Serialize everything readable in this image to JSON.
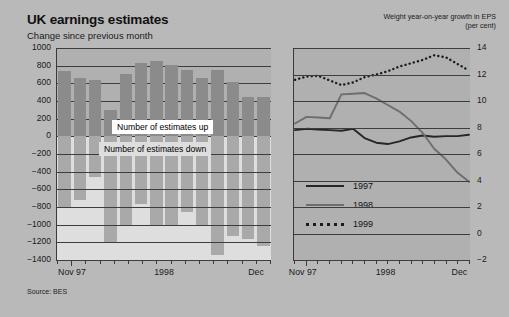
{
  "header": {
    "main_title": "UK earnings estimates",
    "subtitle": "Change since previous month",
    "right_title_line1": "Weight year-on-year growth in EPS",
    "right_title_line2": "(per cent)"
  },
  "source": "Source: BES",
  "colors": {
    "background": "#b9b9b9",
    "plot_background": "#b0b0b0",
    "band_background": "#dedede",
    "bar_up": "#8b8b8b",
    "bar_down": "#a9a9a9",
    "line_1997": "#262626",
    "line_1998": "#6e6e6e",
    "line_1999": "#1c1c1c",
    "axis": "#3a3a3a"
  },
  "chart_data": [
    {
      "type": "bar",
      "id": "uk-earnings-estimates",
      "title": "UK earnings estimates",
      "subtitle": "Change since previous month",
      "xlabel": "",
      "ylabel": "",
      "ylim": [
        -1400,
        1000
      ],
      "yticks": [
        1000,
        800,
        600,
        400,
        200,
        0,
        -200,
        -400,
        -600,
        -800,
        -1000,
        -1200,
        -1400
      ],
      "ytick_labels": [
        "1000",
        "800",
        "600",
        "400",
        "200",
        "0",
        "-200",
        "-400",
        "-600",
        "-800",
        "-1000",
        "-1200",
        "-1400"
      ],
      "grid": true,
      "xtick_labels": [
        "Nov 97",
        "1998",
        "Dec"
      ],
      "xtick_label_positions": [
        0.07,
        0.5,
        0.93
      ],
      "categories": [
        "Nov 97",
        "Dec 97",
        "Jan 98",
        "Feb 98",
        "Mar 98",
        "Apr 98",
        "May 98",
        "Jun 98",
        "Jul 98",
        "Aug 98",
        "Sep 98",
        "Oct 98",
        "Nov 98",
        "Dec 98"
      ],
      "series": [
        {
          "name": "Number of estimates up",
          "values": [
            740,
            660,
            640,
            300,
            710,
            830,
            850,
            805,
            755,
            660,
            750,
            620,
            450,
            445
          ]
        },
        {
          "name": "Number of estimates down",
          "values": [
            -800,
            -720,
            -460,
            -1210,
            -1000,
            -770,
            -1000,
            -1010,
            -855,
            -1000,
            -1340,
            -1130,
            -1160,
            -1240
          ]
        }
      ],
      "band_labels": {
        "up": "Number of estimates up",
        "down": "Number of estimates down"
      }
    },
    {
      "type": "line",
      "id": "weighted-eps-growth",
      "title": "Weight year-on-year growth in EPS",
      "subtitle": "(per cent)",
      "xlabel": "",
      "ylabel": "per cent",
      "ylim": [
        -2,
        14
      ],
      "yticks": [
        14,
        12,
        10,
        8,
        6,
        4,
        2,
        0,
        -2
      ],
      "ytick_labels": [
        "14",
        "12",
        "10",
        "8",
        "6",
        "4",
        "2",
        "0",
        "-2"
      ],
      "grid": true,
      "xtick_labels": [
        "Nov 97",
        "1998",
        "Dec"
      ],
      "xtick_label_positions": [
        0.05,
        0.52,
        0.94
      ],
      "legend_position": "lower-left",
      "series": [
        {
          "name": "1997",
          "style": "solid",
          "color": "#262626",
          "x": [
            0,
            1,
            2,
            3,
            4,
            5,
            6,
            7,
            8,
            9,
            10,
            11,
            12,
            13,
            14,
            15
          ],
          "values": [
            7.8,
            7.9,
            7.85,
            7.8,
            7.75,
            7.9,
            7.2,
            6.85,
            6.75,
            6.95,
            7.25,
            7.4,
            7.3,
            7.35,
            7.35,
            7.45
          ]
        },
        {
          "name": "1998",
          "style": "solid",
          "color": "#6e6e6e",
          "x": [
            0,
            1,
            2,
            3,
            4,
            5,
            6,
            7,
            8,
            9,
            10,
            11,
            12,
            13,
            14,
            15
          ],
          "values": [
            8.3,
            8.8,
            8.75,
            8.7,
            10.5,
            10.55,
            10.6,
            10.2,
            9.7,
            9.2,
            8.5,
            7.6,
            6.4,
            5.6,
            4.6,
            3.9
          ]
        },
        {
          "name": "1999",
          "style": "dotted",
          "color": "#1c1c1c",
          "x": [
            0,
            1,
            2,
            3,
            4,
            5,
            6,
            7,
            8,
            9,
            10,
            11,
            12,
            13,
            14,
            15
          ],
          "values": [
            11.6,
            11.85,
            11.9,
            11.55,
            11.2,
            11.4,
            11.8,
            12.0,
            12.25,
            12.6,
            12.85,
            13.1,
            13.45,
            13.3,
            12.8,
            12.3
          ]
        }
      ]
    }
  ]
}
